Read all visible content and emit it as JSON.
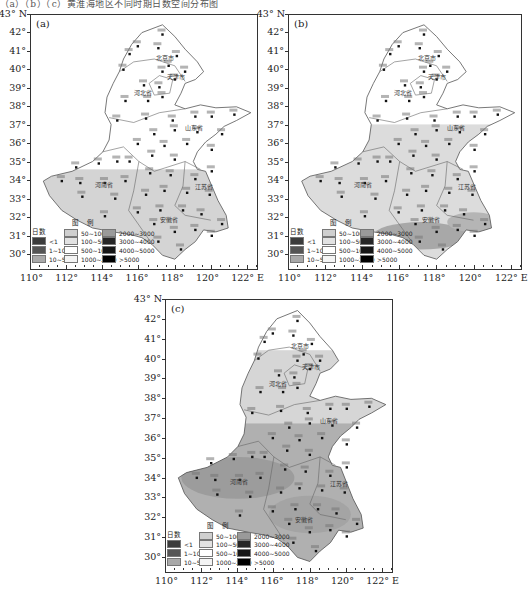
{
  "caption_top": "（a）（b）（c）黄淮海地区不同时期日数空间分布图",
  "legend": {
    "title": "图 例",
    "header": "日数",
    "bins": [
      {
        "label": "<1",
        "color": "#3c3c3c"
      },
      {
        "label": "1~10",
        "color": "#555555"
      },
      {
        "label": "10~50",
        "color": "#a9a9a9"
      },
      {
        "label": "50~100",
        "color": "#cfcfcf"
      },
      {
        "label": "100~500",
        "color": "#e2e2e2"
      },
      {
        "label": "500~1000",
        "color": "#ffffff"
      },
      {
        "label": "1000~2000",
        "color": "#f4f4f4"
      },
      {
        "label": "2000~3000",
        "color": "#9a9a9a"
      },
      {
        "label": "3000~4000",
        "color": "#262626"
      },
      {
        "label": "4000~5000",
        "color": "#161616"
      },
      {
        "label": ">5000",
        "color": "#000000"
      }
    ]
  },
  "axes": {
    "lat_labels": [
      "43° N",
      "42°",
      "41°",
      "40°",
      "39°",
      "38°",
      "37°",
      "36°",
      "35°",
      "34°",
      "33°",
      "32°",
      "31°",
      "30°"
    ],
    "lon_labels": [
      "110°",
      "112°",
      "114°",
      "116°",
      "118°",
      "120°",
      "122° E"
    ]
  },
  "provinces": [
    "北京市",
    "天津市",
    "河北省",
    "山东省",
    "河南省",
    "安徽省",
    "江苏省"
  ],
  "panels": [
    {
      "id": "a",
      "tag": "(a)"
    },
    {
      "id": "b",
      "tag": "(b)"
    },
    {
      "id": "c",
      "tag": "(c)"
    }
  ],
  "chart_data": [
    {
      "type": "heatmap",
      "title": "(a)",
      "xlabel": "Longitude",
      "ylabel": "Latitude",
      "xlim": [
        110,
        122.5
      ],
      "ylim": [
        29.5,
        43
      ],
      "regions": [
        {
          "area": "North (Beijing, Tianjin, Hebei, Shandong, N Henan)",
          "bin": "500~1000"
        },
        {
          "area": "South (S Henan, Anhui, Jiangsu), below ~34.5°N",
          "bin": "100~500"
        }
      ],
      "legend_position": "lower-left"
    },
    {
      "type": "heatmap",
      "title": "(b)",
      "xlabel": "Longitude",
      "ylabel": "Latitude",
      "xlim": [
        110,
        122.5
      ],
      "ylim": [
        29.5,
        43
      ],
      "regions": [
        {
          "area": "North Hebei, Beijing, Tianjin, above ~37°N",
          "bin": "500~1000"
        },
        {
          "area": "Shandong, Henan, Anhui, Jiangsu",
          "bin": "100~500"
        },
        {
          "area": "South Anhui / S Jiangsu, ~30.5–31.5°N",
          "bin": "50~100"
        }
      ],
      "legend_position": "lower-left"
    },
    {
      "type": "heatmap",
      "title": "(c)",
      "xlabel": "Longitude",
      "ylabel": "Latitude",
      "xlim": [
        110,
        122.5
      ],
      "ylim": [
        29.5,
        43
      ],
      "regions": [
        {
          "area": "Northwest Hebei, above ~40.5°N",
          "bin": "500~1000"
        },
        {
          "area": "Central Hebei, Beijing, Tianjin, E Shandong",
          "bin": "100~500"
        },
        {
          "area": "S Hebei, W Shandong, Henan, N Anhui, Jiangsu",
          "bin": "50~100"
        },
        {
          "area": "Central Henan / Anhui band ~33–34°N",
          "bin": "10~50"
        }
      ],
      "legend_position": "lower-left"
    }
  ]
}
